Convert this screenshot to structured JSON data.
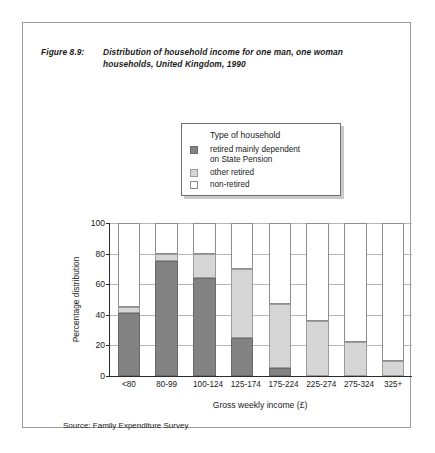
{
  "figure": {
    "number_label": "Figure 8.9:",
    "title_line1": "Distribution of household income for one man, one woman",
    "title_line2": "households, United Kingdom, 1990"
  },
  "legend": {
    "title": "Type of household",
    "items": [
      {
        "label_line1": "retired mainly dependent",
        "label_line2": "on State Pension",
        "color": "#828282"
      },
      {
        "label_line1": "other retired",
        "label_line2": "",
        "color": "#d6d6d6"
      },
      {
        "label_line1": "non-retired",
        "label_line2": "",
        "color": "#ffffff"
      }
    ]
  },
  "source": {
    "text": "Source: Family Expenditure Survey"
  },
  "chart_data": {
    "type": "bar",
    "stacked": true,
    "title": "Distribution of household income for one man, one woman households, United Kingdom, 1990",
    "xlabel": "Gross  weekly  income  (£)",
    "ylabel": "Percentage distribution",
    "ylim": [
      0,
      100
    ],
    "yticks": [
      0,
      20,
      40,
      60,
      80,
      100
    ],
    "ytick_labels": [
      "0",
      "20",
      "40",
      "60",
      "80",
      "100"
    ],
    "grid": true,
    "legend_position": "above-plot",
    "categories": [
      "<80",
      "80-99",
      "100-124",
      "125-174",
      "175-224",
      "225-274",
      "275-324",
      "325+"
    ],
    "series": [
      {
        "name": "retired mainly dependent on State Pension",
        "color": "#828282",
        "values": [
          41,
          75,
          64,
          25,
          5,
          0,
          0,
          0
        ]
      },
      {
        "name": "other retired",
        "color": "#d6d6d6",
        "values": [
          4,
          5,
          16,
          45,
          42,
          36,
          22,
          10
        ]
      },
      {
        "name": "non-retired",
        "color": "#ffffff",
        "values": [
          55,
          20,
          20,
          30,
          53,
          64,
          78,
          90
        ]
      }
    ]
  }
}
